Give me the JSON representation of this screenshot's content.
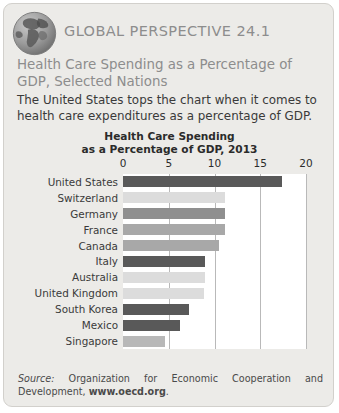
{
  "card": {
    "kicker": "GLOBAL PERSPECTIVE 24.1",
    "subtitle": "Health Care Spending as a Percentage of GDP, Selected Nations",
    "lede": "The United States tops the chart when it comes to health care expenditures as a percentage of GDP.",
    "globe_icon": "globe-americas-icon"
  },
  "source": {
    "label": "Source:",
    "text": " Organization for Economic Cooperation and Development, ",
    "url": "www.oecd.org",
    "period": "."
  },
  "colors": {
    "card_bg": "#ecebe8",
    "card_border": "#d2d0cc",
    "heading_gray": "#8d8d8d",
    "body_text": "#3a3a3a",
    "plot_bg": "#ffffff",
    "gridline": "#b9b9b9",
    "bar_dark": "#595959",
    "bar_light": "#dcdcdc",
    "bar_medium": "#a8a8a8",
    "bar_medium_dark": "#8f8f8f"
  },
  "chart_data": {
    "type": "bar",
    "orientation": "horizontal",
    "title": "Health Care Spending\nas a Percentage of GDP, 2013",
    "title_line1": "Health Care Spending",
    "title_line2": "as a Percentage of GDP, 2013",
    "xlabel": "",
    "ylabel": "",
    "xlim": [
      0,
      20
    ],
    "ticks": [
      0,
      5,
      10,
      15,
      20
    ],
    "tick_labels": [
      "0",
      "5",
      "10",
      "15",
      "20"
    ],
    "grid": true,
    "legend": false,
    "categories": [
      "United States",
      "Switzerland",
      "Germany",
      "France",
      "Canada",
      "Italy",
      "Australia",
      "United Kingdom",
      "South Korea",
      "Mexico",
      "Singapore"
    ],
    "values": [
      17.4,
      11.2,
      11.2,
      11.1,
      10.5,
      9.0,
      9.0,
      8.8,
      7.2,
      6.2,
      4.6
    ],
    "bar_colors": [
      "#595959",
      "#dcdcdc",
      "#8f8f8f",
      "#a8a8a8",
      "#a8a8a8",
      "#595959",
      "#dcdcdc",
      "#dcdcdc",
      "#595959",
      "#595959",
      "#b8b8b8"
    ]
  }
}
